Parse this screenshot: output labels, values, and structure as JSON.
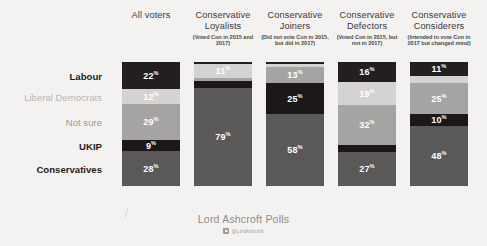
{
  "brand": {
    "name": "Lord Ashcroft Polls",
    "handle": "@LordAshcroft",
    "twitter_icon": "twitter-badge-icon"
  },
  "row_labels": [
    {
      "label": "Labour",
      "style": "strong"
    },
    {
      "label": "Liberal Democrats",
      "style": "faded"
    },
    {
      "label": "Not sure",
      "style": "mid"
    },
    {
      "label": "UKIP",
      "style": "strong"
    },
    {
      "label": "Conservatives",
      "style": "strong"
    }
  ],
  "columns": [
    {
      "title": "All voters",
      "subtitle": ""
    },
    {
      "title": "Conservative Loyalists",
      "subtitle": "(Voted Con in 2015 and 2017)"
    },
    {
      "title": "Conservative Joiners",
      "subtitle": "(Did not vote Con in 2015, but did in 2017)"
    },
    {
      "title": "Conservative Defectors",
      "subtitle": "(Voted Con in 2015, but not in 2017)"
    },
    {
      "title": "Conservative Considerers",
      "subtitle": "(Intended to vote Con in 2017 but changed mind)"
    }
  ],
  "colors": {
    "labour": "#231f20",
    "liberal_democrats": "#d5d3d1",
    "not_sure": "#a6a4a2",
    "ukip": "#1b1817",
    "conservatives": "#5a5957",
    "background": "#f3f2f0",
    "label_text": "#ffffff"
  },
  "chart_data": {
    "type": "bar",
    "subtype": "stacked-100-percent-vertical",
    "title": "",
    "xlabel": "",
    "ylabel": "",
    "ylim": [
      0,
      100
    ],
    "grid": false,
    "legend": "row-labels-left",
    "categories": [
      "All voters",
      "Conservative Loyalists",
      "Conservative Joiners",
      "Conservative Defectors",
      "Conservative Considerers"
    ],
    "series": [
      {
        "name": "Labour",
        "values": [
          22,
          2,
          2,
          16,
          11
        ]
      },
      {
        "name": "Liberal Democrats",
        "values": [
          12,
          11,
          2,
          19,
          6
        ]
      },
      {
        "name": "Not sure",
        "values": [
          29,
          2,
          13,
          32,
          25
        ]
      },
      {
        "name": "UKIP",
        "values": [
          9,
          6,
          25,
          6,
          10
        ]
      },
      {
        "name": "Conservatives",
        "values": [
          28,
          79,
          58,
          27,
          48
        ]
      }
    ],
    "value_labels": {
      "All voters": {
        "Labour": "22",
        "Liberal Democrats": "12",
        "Not sure": "29",
        "UKIP": "9",
        "Conservatives": "28"
      },
      "Conservative Loyalists": {
        "Labour": "",
        "Liberal Democrats": "11",
        "Not sure": "",
        "UKIP": "",
        "Conservatives": "79"
      },
      "Conservative Joiners": {
        "Labour": "",
        "Liberal Democrats": "",
        "Not sure": "13",
        "UKIP": "25",
        "Conservatives": "58"
      },
      "Conservative Defectors": {
        "Labour": "16",
        "Liberal Democrats": "19",
        "Not sure": "32",
        "UKIP": "",
        "Conservatives": "27"
      },
      "Conservative Considerers": {
        "Labour": "11",
        "Liberal Democrats": "",
        "Not sure": "25",
        "UKIP": "10",
        "Conservatives": "48"
      }
    },
    "percent_symbol": "%"
  }
}
